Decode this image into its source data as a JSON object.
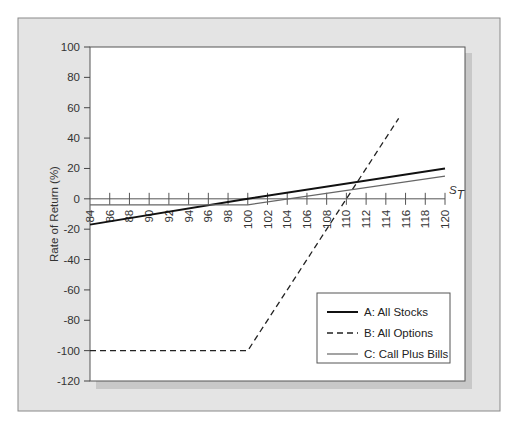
{
  "chart_data": {
    "type": "line",
    "title": "",
    "xlabel": "S_T",
    "xlabel_main": "S",
    "xlabel_sub": "T",
    "ylabel": "Rate of Return (%)",
    "xlim": [
      84,
      120
    ],
    "ylim": [
      -120,
      100
    ],
    "x_ticks": [
      84,
      86,
      88,
      90,
      92,
      94,
      96,
      98,
      100,
      102,
      104,
      106,
      108,
      110,
      112,
      114,
      116,
      118,
      120
    ],
    "y_ticks": [
      100,
      80,
      60,
      40,
      20,
      0,
      -20,
      -40,
      -60,
      -80,
      -100,
      -120
    ],
    "grid": false,
    "legend_position": "bottom-right",
    "series": [
      {
        "name": "A: All Stocks",
        "style": "solid-thick",
        "color": "#111111",
        "points": [
          [
            84,
            -17
          ],
          [
            100,
            0
          ],
          [
            120,
            20
          ]
        ]
      },
      {
        "name": "B: All Options",
        "style": "dashed",
        "color": "#222222",
        "points": [
          [
            84,
            -100
          ],
          [
            100,
            -100
          ],
          [
            110,
            0
          ],
          [
            115.3,
            53
          ]
        ]
      },
      {
        "name": "C: Call Plus Bills",
        "style": "solid-thin",
        "color": "#666666",
        "points": [
          [
            84,
            -4
          ],
          [
            100,
            -4
          ],
          [
            120,
            15
          ]
        ]
      }
    ]
  }
}
